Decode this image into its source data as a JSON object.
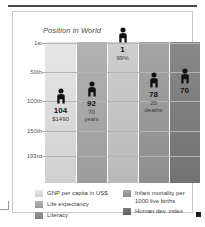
{
  "chart_data": {
    "type": "bar",
    "title": "Position in World",
    "xlabel": "",
    "ylabel": "",
    "ylim": [
      1,
      193
    ],
    "grid": true,
    "legend_position": "bottom",
    "y_ticks": [
      {
        "label": "1st",
        "value": 1
      },
      {
        "label": "50th",
        "value": 50
      },
      {
        "label": "100th",
        "value": 100
      },
      {
        "label": "150th",
        "value": 150
      },
      {
        "label": "193rd",
        "value": 193
      }
    ],
    "categories": [
      "GNP per capita in US$",
      "Life expectancy",
      "Literacy",
      "Infant mortality per 1000 live births",
      "Human dev. index"
    ],
    "values": [
      104,
      92,
      1,
      78,
      70
    ],
    "points": [
      {
        "category": "GNP per capita in US$",
        "rank": "104",
        "rank_value": 104,
        "sub": "$1490",
        "sub_lines": [
          "$1490"
        ],
        "band_color": "#dcdcdc"
      },
      {
        "category": "Life expectancy",
        "rank": "92",
        "rank_value": 92,
        "sub": "70 years",
        "sub_lines": [
          "70",
          "years"
        ],
        "band_color": "#a8a8a8"
      },
      {
        "category": "Literacy",
        "rank": "1",
        "rank_value": 1,
        "sub": "99%",
        "sub_lines": [
          "99%"
        ],
        "band_color": "#c4c4c4"
      },
      {
        "category": "Infant mortality per 1000 live births",
        "rank": "78",
        "rank_value": 78,
        "sub": "20 deaths",
        "sub_lines": [
          "20",
          "deaths"
        ],
        "band_color": "#9a9a9a"
      },
      {
        "category": "Human dev. index",
        "rank": "70",
        "rank_value": 70,
        "sub": "",
        "sub_lines": [],
        "band_color": "#7e7e7e"
      }
    ]
  },
  "legend": {
    "left": [
      {
        "label": "GNP per capita in US$",
        "color": "#dcdcdc"
      },
      {
        "label": "Life expectancy",
        "color": "#a8a8a8"
      },
      {
        "label": "Literacy",
        "color": "#8c8c8c"
      }
    ],
    "right": [
      {
        "label": "Infant mortality per",
        "label2": "1000 live births",
        "color": "#9a9a9a"
      },
      {
        "label": "Human dev. index",
        "label2": "",
        "color": "#6e6e6e"
      }
    ]
  }
}
